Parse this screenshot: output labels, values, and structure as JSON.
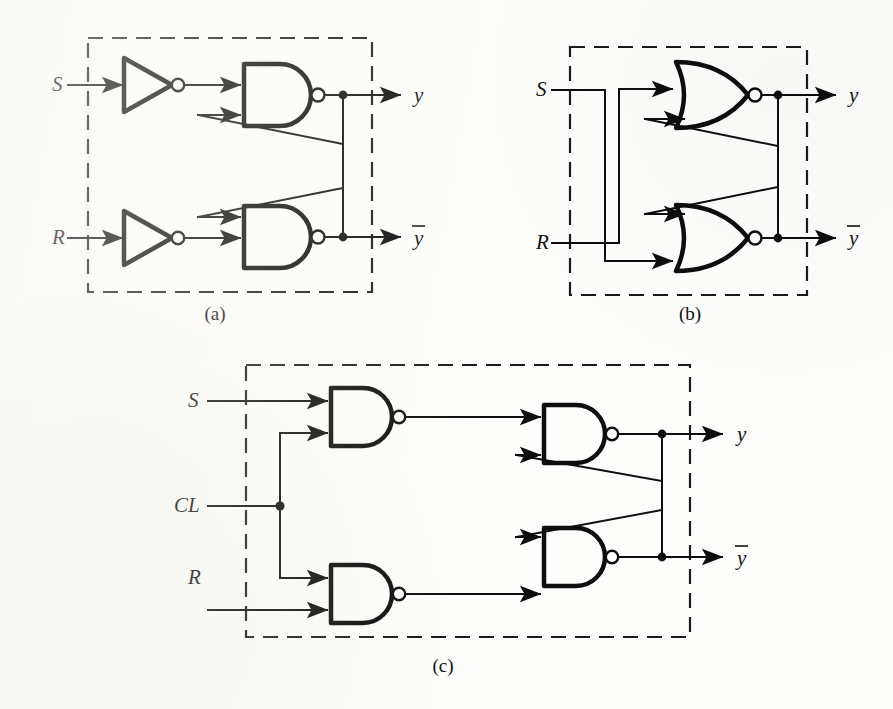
{
  "figure": {
    "background_color": "#fdfdfb",
    "ink_color": "#0d0d0d",
    "panels": [
      {
        "id": "a",
        "caption": "(a)",
        "gate_type": "NAND",
        "description": "SR latch built from two cross-coupled NAND gates driven by inverters",
        "inputs": [
          {
            "name": "S",
            "label": "S"
          },
          {
            "name": "R",
            "label": "R"
          }
        ],
        "outputs": [
          {
            "name": "y",
            "label": "y",
            "overbar": false
          },
          {
            "name": "ybar",
            "label": "y",
            "overbar": true
          }
        ],
        "elements": [
          "inverter",
          "inverter",
          "nand-gate",
          "nand-gate"
        ]
      },
      {
        "id": "b",
        "caption": "(b)",
        "gate_type": "NOR",
        "description": "SR latch built from two cross-coupled NOR gates",
        "inputs": [
          {
            "name": "S",
            "label": "S"
          },
          {
            "name": "R",
            "label": "R"
          }
        ],
        "outputs": [
          {
            "name": "y",
            "label": "y",
            "overbar": false
          },
          {
            "name": "ybar",
            "label": "y",
            "overbar": true
          }
        ],
        "elements": [
          "nor-gate",
          "nor-gate"
        ]
      },
      {
        "id": "c",
        "caption": "(c)",
        "gate_type": "NAND",
        "description": "Clocked SR latch built from four NAND gates with a CL clock enable input",
        "inputs": [
          {
            "name": "S",
            "label": "S"
          },
          {
            "name": "CL",
            "label": "CL"
          },
          {
            "name": "R",
            "label": "R"
          }
        ],
        "outputs": [
          {
            "name": "y",
            "label": "y",
            "overbar": false
          },
          {
            "name": "ybar",
            "label": "y",
            "overbar": true
          }
        ],
        "elements": [
          "nand-gate",
          "nand-gate",
          "nand-gate",
          "nand-gate"
        ]
      }
    ]
  }
}
